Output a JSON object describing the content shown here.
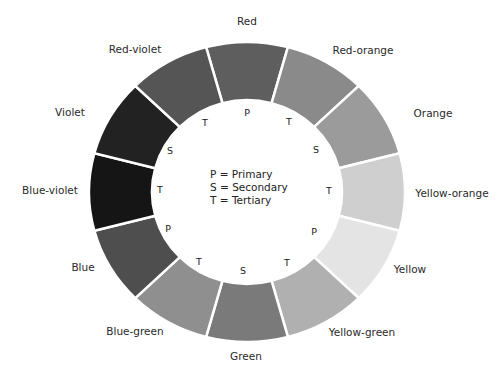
{
  "geometry": {
    "cx": 247,
    "cy": 192,
    "rx_outer": 158,
    "ry_outer": 150,
    "rx_inner": 95,
    "ry_inner": 92,
    "gap_color": "#ffffff"
  },
  "segments": [
    {
      "name": "Red",
      "type": "P",
      "color": "#5e5e5e",
      "label_x": 247,
      "label_y": 21,
      "code_x": 247,
      "code_y": 112
    },
    {
      "name": "Red-orange",
      "type": "T",
      "color": "#8a8a8a",
      "label_x": 363,
      "label_y": 50,
      "code_x": 289,
      "code_y": 121
    },
    {
      "name": "Orange",
      "type": "S",
      "color": "#9b9b9b",
      "label_x": 433,
      "label_y": 113,
      "code_x": 316,
      "code_y": 149
    },
    {
      "name": "Yellow-orange",
      "type": "T",
      "color": "#cfcfcf",
      "label_x": 452,
      "label_y": 193,
      "code_x": 329,
      "code_y": 190
    },
    {
      "name": "Yellow",
      "type": "P",
      "color": "#e4e4e4",
      "label_x": 410,
      "label_y": 269,
      "code_x": 314,
      "code_y": 231
    },
    {
      "name": "Yellow-green",
      "type": "T",
      "color": "#b0b0b0",
      "label_x": 362,
      "label_y": 332,
      "code_x": 287,
      "code_y": 262
    },
    {
      "name": "Green",
      "type": "S",
      "color": "#7a7a7a",
      "label_x": 246,
      "label_y": 356,
      "code_x": 243,
      "code_y": 270
    },
    {
      "name": "Blue-green",
      "type": "T",
      "color": "#8f8f8f",
      "label_x": 135,
      "label_y": 331,
      "code_x": 199,
      "code_y": 261
    },
    {
      "name": "Blue",
      "type": "P",
      "color": "#4e4e4e",
      "label_x": 83,
      "label_y": 267,
      "code_x": 168,
      "code_y": 228
    },
    {
      "name": "Blue-violet",
      "type": "T",
      "color": "#151515",
      "label_x": 50,
      "label_y": 190,
      "code_x": 160,
      "code_y": 189
    },
    {
      "name": "Violet",
      "type": "S",
      "color": "#222222",
      "label_x": 70,
      "label_y": 112,
      "code_x": 170,
      "code_y": 150
    },
    {
      "name": "Red-violet",
      "type": "T",
      "color": "#555555",
      "label_x": 135,
      "label_y": 49,
      "code_x": 205,
      "code_y": 122
    }
  ],
  "legend": [
    "P = Primary",
    "S = Secondary",
    "T = Tertiary"
  ]
}
